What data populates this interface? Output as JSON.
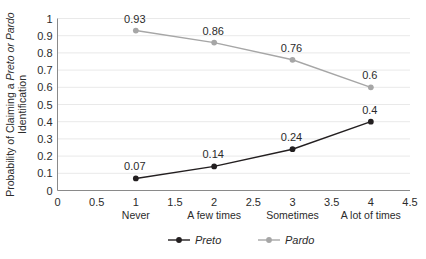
{
  "chart_data": {
    "type": "line",
    "title": "",
    "xlabel": "",
    "ylabel": "Probability of Claiming a Preto or Pardo Identification",
    "ylabel_line1_pre": "Probability of Claiming a ",
    "ylabel_line1_em": "Preto or Pardo",
    "ylabel_line2": "Identification",
    "x": [
      1,
      2,
      3,
      4
    ],
    "categories": [
      "Never",
      "A few times",
      "Sometimes",
      "A lot of times"
    ],
    "xlim": [
      0,
      4.5
    ],
    "ylim": [
      0,
      1
    ],
    "xticks": [
      "0",
      "0.5",
      "1",
      "1.5",
      "2",
      "2.5",
      "3",
      "3.5",
      "4",
      "4.5"
    ],
    "xtick_values": [
      0,
      0.5,
      1,
      1.5,
      2,
      2.5,
      3,
      3.5,
      4,
      4.5
    ],
    "yticks": [
      "0",
      "0.1",
      "0.2",
      "0.3",
      "0.4",
      "0.5",
      "0.6",
      "0.7",
      "0.8",
      "0.9",
      "1"
    ],
    "ytick_values": [
      0,
      0.1,
      0.2,
      0.3,
      0.4,
      0.5,
      0.6,
      0.7,
      0.8,
      0.9,
      1
    ],
    "grid": "horizontal",
    "legend_position": "bottom",
    "series": [
      {
        "name": "Preto",
        "color": "#231f20",
        "values": [
          0.07,
          0.14,
          0.24,
          0.4
        ],
        "labels": [
          "0.07",
          "0.14",
          "0.24",
          "0.4"
        ]
      },
      {
        "name": "Pardo",
        "color": "#a6a6a6",
        "values": [
          0.93,
          0.86,
          0.76,
          0.6
        ],
        "labels": [
          "0.93",
          "0.86",
          "0.76",
          "0.6"
        ]
      }
    ]
  },
  "legend": {
    "items": [
      {
        "label": "Preto",
        "color": "#231f20"
      },
      {
        "label": "Pardo",
        "color": "#a6a6a6"
      }
    ]
  },
  "caption": {
    "text": ""
  }
}
